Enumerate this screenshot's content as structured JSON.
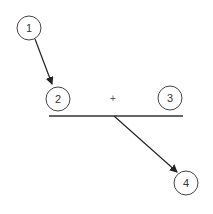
{
  "diagram": {
    "nodes": [
      {
        "id": "n1",
        "label": "1",
        "cx": 29,
        "cy": 28,
        "r": 12
      },
      {
        "id": "n2",
        "label": "2",
        "cx": 58,
        "cy": 99,
        "r": 12
      },
      {
        "id": "n3",
        "label": "3",
        "cx": 170,
        "cy": 98,
        "r": 12
      },
      {
        "id": "n4",
        "label": "4",
        "cx": 186,
        "cy": 183,
        "r": 12
      }
    ],
    "operator": {
      "symbol": "+",
      "x": 113,
      "y": 99
    },
    "bar": {
      "x1": 49,
      "y1": 116,
      "x2": 183,
      "y2": 116
    },
    "edges": [
      {
        "from": "1",
        "to": "2"
      },
      {
        "from": "bar",
        "to": "4"
      }
    ],
    "colors": {
      "stroke": "#333333",
      "background": "#ffffff"
    }
  }
}
